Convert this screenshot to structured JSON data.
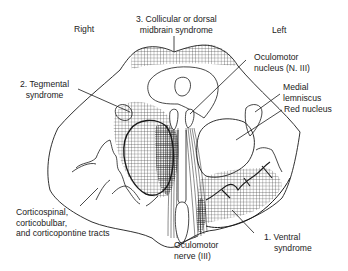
{
  "figure": {
    "orientation": {
      "right_label": "Right",
      "left_label": "Left"
    },
    "labels": {
      "collicular": {
        "line1": "3. Collicular or dorsal",
        "line2": "midbrain syndrome"
      },
      "tegmental": {
        "line1": "2. Tegmental",
        "line2": "syndrome"
      },
      "oculomotor_nucleus": {
        "line1": "Oculomotor",
        "line2": "nucleus (N. III)"
      },
      "medial_lemniscus": {
        "line1": "Medial",
        "line2": "lemniscus"
      },
      "red_nucleus": {
        "line1": "Red nucleus"
      },
      "corticospinal": {
        "line1": "Corticospinal,",
        "line2": "corticobulbar,",
        "line3": "and corticopontine tracts"
      },
      "oculomotor_nerve": {
        "line1": "Oculomotor",
        "line2": "nerve (III)"
      },
      "ventral": {
        "line1": "1. Ventral",
        "line2": "syndrome"
      }
    },
    "colors": {
      "stroke": "#1a1a1a",
      "hatch": "#333333",
      "background": "#ffffff"
    }
  }
}
